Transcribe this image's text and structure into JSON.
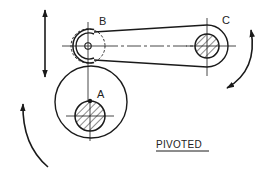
{
  "diagram": {
    "title": "PIVOTED",
    "labels": {
      "a": "A",
      "b": "B",
      "c": "C"
    },
    "components": [
      {
        "id": "cam",
        "name": "Eccentric cam rotating about shaft A"
      },
      {
        "id": "follower-roller",
        "name": "Roller follower at B"
      },
      {
        "id": "lever-arm",
        "name": "Pivoted lever from B to C"
      },
      {
        "id": "pivot-shaft",
        "name": "Pivot shaft C"
      }
    ],
    "motions": [
      {
        "id": "follower-motion",
        "type": "linear reciprocating",
        "icon": "double-arrow-vertical"
      },
      {
        "id": "lever-oscillation",
        "type": "oscillating",
        "icon": "double-arrow-arc"
      },
      {
        "id": "cam-rotation",
        "type": "rotation",
        "icon": "arc-arrow"
      }
    ],
    "colors": {
      "line": "#1a1a1a",
      "background": "#ffffff"
    }
  }
}
